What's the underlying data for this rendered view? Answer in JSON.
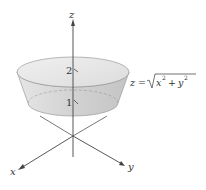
{
  "figure": {
    "axes": {
      "z_label": "z",
      "x_label": "x",
      "y_label": "y"
    },
    "ticks": {
      "top": "2",
      "bottom": "1"
    },
    "equation": {
      "lhs": "z =",
      "radicand_x": "x",
      "radicand_plus": "+",
      "radicand_y": "y",
      "exp": "2"
    },
    "colors": {
      "surface_fill": "#d9d9d9",
      "surface_edge": "#9a9a9a",
      "axis": "#444444"
    }
  }
}
